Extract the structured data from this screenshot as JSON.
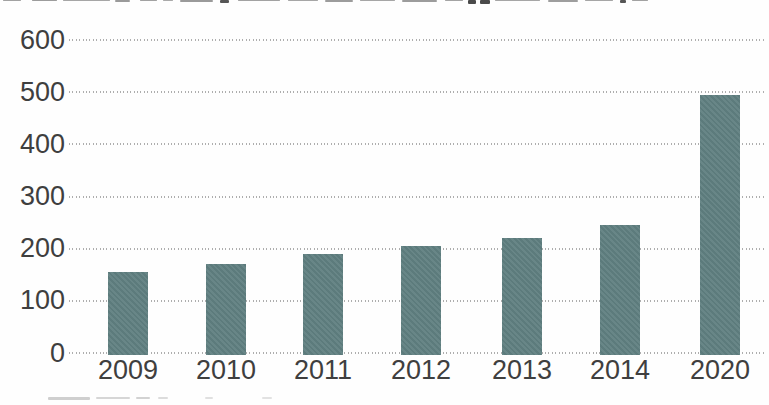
{
  "figure": {
    "cropped_title_visible": true,
    "cropped_caption_visible": true
  },
  "y_axis": {
    "tick_labels": [
      "600",
      "500",
      "400",
      "300",
      "200",
      "100",
      "0"
    ]
  },
  "x_axis": {
    "tick_labels": [
      "2009",
      "2010",
      "2011",
      "2012",
      "2013",
      "2014",
      "2020"
    ]
  },
  "chart_data": {
    "type": "bar",
    "categories": [
      "2009",
      "2010",
      "2011",
      "2012",
      "2013",
      "2014",
      "2020"
    ],
    "values": [
      155,
      170,
      190,
      205,
      220,
      245,
      495
    ],
    "ylim": [
      0,
      600
    ],
    "ytick_interval": 100,
    "grid": "horizontal dotted",
    "legend_position": "none",
    "bar_color": "#608081",
    "axis_text_color": "#3f3f3f",
    "gridline_color": "#aeaeae",
    "background_color": "#ffffff"
  }
}
